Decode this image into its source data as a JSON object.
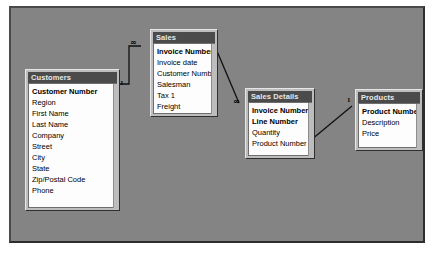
{
  "window": {
    "title": "Relationships",
    "canvas_background": "#848484",
    "table_title_background": "#4b4b4b",
    "table_title_color": "#e8e8e8",
    "table_body_background": "#fdfdfd"
  },
  "tables": [
    {
      "name": "Customers",
      "fields": [
        {
          "label": "Customer Number",
          "key": true
        },
        {
          "label": "Region",
          "key": false
        },
        {
          "label": "First Name",
          "key": false
        },
        {
          "label": "Last Name",
          "key": false
        },
        {
          "label": "Company",
          "key": false
        },
        {
          "label": "Street",
          "key": false
        },
        {
          "label": "City",
          "key": false
        },
        {
          "label": "State",
          "key": false
        },
        {
          "label": "Zip/Postal Code",
          "key": false
        },
        {
          "label": "Phone",
          "key": false
        }
      ]
    },
    {
      "name": "Sales",
      "fields": [
        {
          "label": "Invoice Number",
          "key": true
        },
        {
          "label": "Invoice date",
          "key": false
        },
        {
          "label": "Customer Number",
          "key": false
        },
        {
          "label": "Salesman",
          "key": false
        },
        {
          "label": "Tax 1",
          "key": false
        },
        {
          "label": "Freight",
          "key": false
        }
      ]
    },
    {
      "name": "Sales Details",
      "fields": [
        {
          "label": "Invoice Number",
          "key": true
        },
        {
          "label": "Line Number",
          "key": true
        },
        {
          "label": "Quantity",
          "key": false
        },
        {
          "label": "Product Number",
          "key": false
        }
      ]
    },
    {
      "name": "Products",
      "fields": [
        {
          "label": "Product Number",
          "key": true
        },
        {
          "label": "Description",
          "key": false
        },
        {
          "label": "Price",
          "key": false
        }
      ]
    }
  ],
  "relationships": [
    {
      "from_table": "Customers",
      "from_field": "Customer Number",
      "to_table": "Sales",
      "to_field": "Customer Number",
      "from_cardinality": "1",
      "to_cardinality": "∞"
    },
    {
      "from_table": "Sales",
      "from_field": "Invoice Number",
      "to_table": "Sales Details",
      "to_field": "Invoice Number",
      "from_cardinality": "1",
      "to_cardinality": "∞"
    },
    {
      "from_table": "Products",
      "from_field": "Product Number",
      "to_table": "Sales Details",
      "to_field": "Product Number",
      "from_cardinality": "1",
      "to_cardinality": "∞"
    }
  ],
  "cardinality_markers": [
    {
      "id": "cust-one",
      "text": "1"
    },
    {
      "id": "sales-many",
      "text": "∞"
    },
    {
      "id": "sales-one",
      "text": "1"
    },
    {
      "id": "saledet-many",
      "text": "∞"
    },
    {
      "id": "saledet-many2",
      "text": "∞"
    },
    {
      "id": "products-one",
      "text": "1"
    }
  ]
}
